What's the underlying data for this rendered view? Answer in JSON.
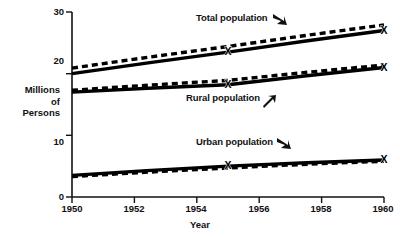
{
  "chart_data": {
    "type": "line",
    "title": "",
    "xlabel": "Year",
    "ylabel": "Millions of Persons",
    "ylabel_lines": [
      "Millions",
      "of",
      "Persons"
    ],
    "xlim": [
      1950,
      1960
    ],
    "ylim": [
      0,
      30
    ],
    "x_ticks": [
      "1950",
      "1952",
      "1954",
      "1956",
      "1958",
      "1960"
    ],
    "x_tick_values": [
      1950,
      1952,
      1954,
      1956,
      1958,
      1960
    ],
    "y_ticks": [
      "0",
      "10",
      "20",
      "30"
    ],
    "y_tick_values": [
      0,
      10,
      20,
      30
    ],
    "grid": false,
    "legend_position": "inline-annotations",
    "marker": "X",
    "marker_x_values": [
      1955,
      1960
    ],
    "line_color": "#000000",
    "series": [
      {
        "name": "Total population",
        "style": "solid-and-dashed-pair",
        "x": [
          1950,
          1955,
          1960
        ],
        "values": [
          20.0,
          23.5,
          27.0
        ],
        "marker_labels": [
          "",
          "X",
          "X"
        ]
      },
      {
        "name": "Rural population",
        "style": "solid-and-dashed-pair",
        "x": [
          1950,
          1955,
          1960
        ],
        "values": [
          17.0,
          18.2,
          21.0
        ],
        "values_dashed": [
          17.3,
          18.9,
          21.4
        ],
        "marker_labels": [
          "",
          "X",
          "X"
        ]
      },
      {
        "name": "Urban population",
        "style": "solid-and-dashed-pair",
        "x": [
          1950,
          1955,
          1960
        ],
        "values": [
          3.5,
          5.0,
          6.0
        ],
        "values_dashed": [
          3.3,
          4.7,
          5.8
        ],
        "marker_labels": [
          "",
          "X",
          "X"
        ]
      }
    ],
    "annotations": [
      {
        "text": "Total population",
        "arrow": "down-right",
        "x_px": 196,
        "y_px": 12
      },
      {
        "text": "Rural population",
        "arrow": "up-right",
        "x_px": 186,
        "y_px": 92
      },
      {
        "text": "Urban population",
        "arrow": "down-right",
        "x_px": 196,
        "y_px": 136
      }
    ]
  }
}
